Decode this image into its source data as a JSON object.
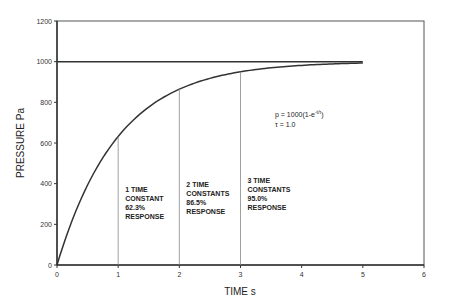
{
  "chart_data": {
    "type": "line",
    "title": "",
    "xlabel": "TIME s",
    "ylabel": "PRESSURE Pa",
    "xlim": [
      0,
      6
    ],
    "ylim": [
      0,
      1200
    ],
    "x_ticks": [
      "0",
      "1",
      "2",
      "3",
      "4",
      "5",
      "6"
    ],
    "y_ticks": [
      "0",
      "200",
      "400",
      "600",
      "800",
      "1000",
      "1200"
    ],
    "grid": false,
    "series": [
      {
        "name": "p = 1000(1-e^(-t/τ))",
        "x": [
          0,
          0.25,
          0.5,
          0.75,
          1,
          1.5,
          2,
          2.5,
          3,
          3.5,
          4,
          4.5,
          5
        ],
        "values": [
          0,
          221,
          393,
          528,
          632,
          777,
          865,
          918,
          950,
          970,
          982,
          989,
          993
        ]
      },
      {
        "name": "Final value 1000",
        "x": [
          0,
          5
        ],
        "values": [
          1000,
          1000
        ]
      }
    ],
    "markers": [
      {
        "x": 1,
        "y": 632,
        "label": [
          "1 TIME",
          "CONSTANT",
          "62.3%",
          "RESPONSE"
        ]
      },
      {
        "x": 2,
        "y": 865,
        "label": [
          "2 TIME",
          "CONSTANTS",
          "86.5%",
          "RESPONSE"
        ]
      },
      {
        "x": 3,
        "y": 950,
        "label": [
          "3 TIME",
          "CONSTANTS",
          "95.0%",
          "RESPONSE"
        ]
      }
    ],
    "annotations": {
      "formula_base": "p = 1000(1-e",
      "formula_exp": "-t/τ",
      "formula_end": ")",
      "tau": "τ = 1.0"
    }
  }
}
